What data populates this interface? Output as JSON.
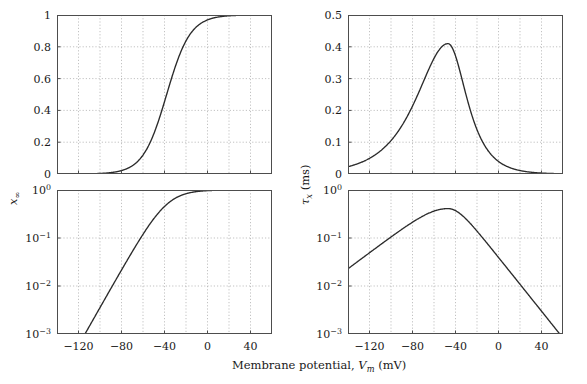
{
  "figure": {
    "width": 587,
    "height": 384,
    "background": "#ffffff",
    "curve_color": "#2b2b2b",
    "grid_color": "#a8a8a8",
    "axis_color": "#4d4d4d",
    "xlabel": "Membrane potential, V_m (mV)",
    "xlabel_parts": {
      "text1": "Membrane potential,",
      "vsym": "V",
      "vsub": "m",
      "units": "(mV)"
    },
    "ylabel_left": "x_∞",
    "ylabel_left_parts": {
      "sym": "x",
      "sub": "∞"
    },
    "ylabel_right": "τ_x (ms)",
    "ylabel_right_parts": {
      "sym": "τ",
      "sub": "x",
      "units": "(ms)"
    }
  },
  "chart_data": [
    {
      "id": "top-left",
      "type": "line",
      "title": "",
      "xlabel": "",
      "ylabel": "x∞",
      "xlim": [
        -140,
        60
      ],
      "ylim": [
        0,
        1
      ],
      "yscale": "linear",
      "grid": true,
      "grid_x_step": 20,
      "xticks": [
        -120,
        -80,
        -40,
        0,
        40
      ],
      "xticklabels": [
        "−120",
        "−80",
        "−40",
        "0",
        "40"
      ],
      "yticks": [
        0,
        0.2,
        0.4,
        0.6,
        0.8,
        1
      ],
      "yticklabels": [
        "0",
        "0.2",
        "0.4",
        "0.6",
        "0.8",
        "1"
      ],
      "legend": null,
      "model": "boltzmann sigmoid x_inf = 1/(1+exp(-(V-V_half)/k))",
      "v_half": -38,
      "slope_k": 11,
      "x": [
        -140,
        -130,
        -120,
        -110,
        -100,
        -90,
        -80,
        -70,
        -60,
        -50,
        -40,
        -30,
        -20,
        -10,
        0,
        10,
        20,
        30,
        40,
        50,
        60
      ],
      "y": [
        0.0001,
        0.0002,
        0.0006,
        0.0014,
        0.0036,
        0.0091,
        0.0224,
        0.0543,
        0.125,
        0.259,
        0.45,
        0.66,
        0.828,
        0.925,
        0.97,
        0.989,
        0.996,
        0.998,
        0.999,
        1.0,
        1.0
      ]
    },
    {
      "id": "top-right",
      "type": "line",
      "title": "",
      "xlabel": "",
      "ylabel": "τx (ms)",
      "xlim": [
        -140,
        60
      ],
      "ylim": [
        0,
        0.5
      ],
      "yscale": "linear",
      "grid": true,
      "grid_x_step": 20,
      "xticks": [
        -120,
        -80,
        -40,
        0,
        40
      ],
      "xticklabels": [
        "−120",
        "−80",
        "−40",
        "0",
        "40"
      ],
      "yticks": [
        0,
        0.1,
        0.2,
        0.3,
        0.4,
        0.5
      ],
      "yticklabels": [
        "0",
        "0.1",
        "0.2",
        "0.3",
        "0.4",
        "0.5"
      ],
      "legend": null,
      "peak_value": 0.41,
      "peak_position": -47,
      "x": [
        -140,
        -130,
        -120,
        -110,
        -100,
        -90,
        -80,
        -70,
        -60,
        -50,
        -47,
        -40,
        -30,
        -20,
        -10,
        0,
        10,
        20,
        30,
        40,
        50,
        60
      ],
      "y": [
        0.033,
        0.039,
        0.047,
        0.058,
        0.072,
        0.093,
        0.122,
        0.165,
        0.235,
        0.345,
        0.41,
        0.395,
        0.275,
        0.165,
        0.095,
        0.055,
        0.033,
        0.021,
        0.014,
        0.0095,
        0.0065,
        0.0048
      ]
    },
    {
      "id": "bottom-left",
      "type": "line",
      "title": "",
      "xlabel": "Membrane potential, Vm (mV)",
      "ylabel": "x∞",
      "xlim": [
        -140,
        60
      ],
      "ylim": [
        0.001,
        1
      ],
      "yscale": "log",
      "grid": true,
      "grid_x_step": 20,
      "xticks": [
        -120,
        -80,
        -40,
        0,
        40
      ],
      "xticklabels": [
        "−120",
        "−80",
        "−40",
        "0",
        "40"
      ],
      "yticks": [
        0.001,
        0.01,
        0.1,
        1
      ],
      "yticklabels": [
        "10⁻³",
        "10⁻²",
        "10⁻¹",
        "10⁰"
      ],
      "legend": null,
      "x": [
        -140,
        -130,
        -120,
        -110,
        -100,
        -90,
        -80,
        -70,
        -60,
        -50,
        -40,
        -30,
        -20,
        -10,
        0,
        10,
        20,
        30,
        40,
        50,
        60
      ],
      "y": [
        0.0001,
        0.0002,
        0.0006,
        0.0014,
        0.0036,
        0.0091,
        0.0224,
        0.0543,
        0.125,
        0.259,
        0.45,
        0.66,
        0.828,
        0.925,
        0.97,
        0.989,
        0.996,
        0.998,
        0.999,
        1.0,
        1.0
      ]
    },
    {
      "id": "bottom-right",
      "type": "line",
      "title": "",
      "xlabel": "Membrane potential, Vm (mV)",
      "ylabel": "τx (ms)",
      "xlim": [
        -140,
        60
      ],
      "ylim": [
        0.001,
        1
      ],
      "yscale": "log",
      "grid": true,
      "grid_x_step": 20,
      "xticks": [
        -120,
        -80,
        -40,
        0,
        40
      ],
      "xticklabels": [
        "−120",
        "−80",
        "−40",
        "0",
        "40"
      ],
      "yticks": [
        0.001,
        0.01,
        0.1,
        1
      ],
      "yticklabels": [
        "10⁻³",
        "10⁻²",
        "10⁻¹",
        "10⁰"
      ],
      "legend": null,
      "peak_value": 0.41,
      "peak_position": -47,
      "x": [
        -140,
        -130,
        -120,
        -110,
        -100,
        -90,
        -80,
        -70,
        -60,
        -50,
        -47,
        -40,
        -30,
        -20,
        -10,
        0,
        10,
        20,
        30,
        40,
        50,
        60
      ],
      "y": [
        0.033,
        0.039,
        0.047,
        0.058,
        0.072,
        0.093,
        0.122,
        0.165,
        0.235,
        0.345,
        0.41,
        0.395,
        0.275,
        0.165,
        0.095,
        0.055,
        0.033,
        0.021,
        0.014,
        0.0095,
        0.0065,
        0.0048
      ]
    }
  ]
}
